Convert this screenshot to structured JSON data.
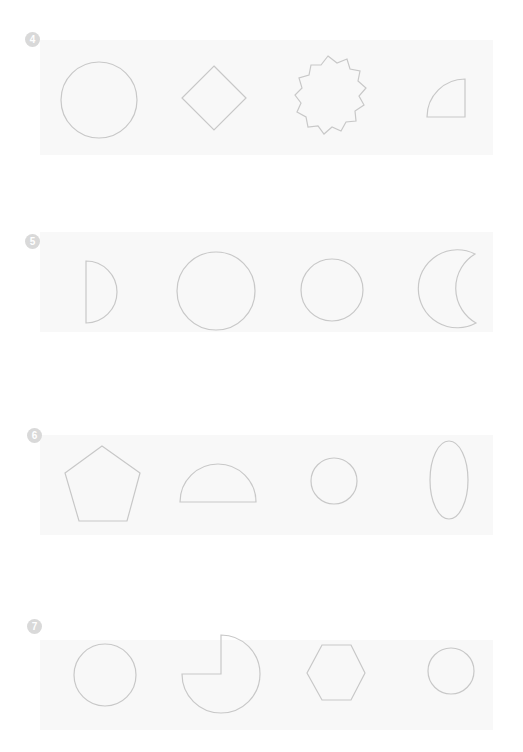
{
  "page": {
    "stroke_color": "#c8c8c8",
    "marker_color": "#d9d9d9"
  },
  "rows": [
    {
      "number": "4",
      "shapes": [
        "circle",
        "diamond",
        "star",
        "quarter-circle"
      ]
    },
    {
      "number": "5",
      "shapes": [
        "semicircle",
        "circle",
        "circle",
        "crescent"
      ]
    },
    {
      "number": "6",
      "shapes": [
        "pentagon",
        "semicircle",
        "circle",
        "ellipse"
      ]
    },
    {
      "number": "7",
      "shapes": [
        "circle",
        "three-quarter-circle",
        "hexagon",
        "circle"
      ]
    }
  ]
}
